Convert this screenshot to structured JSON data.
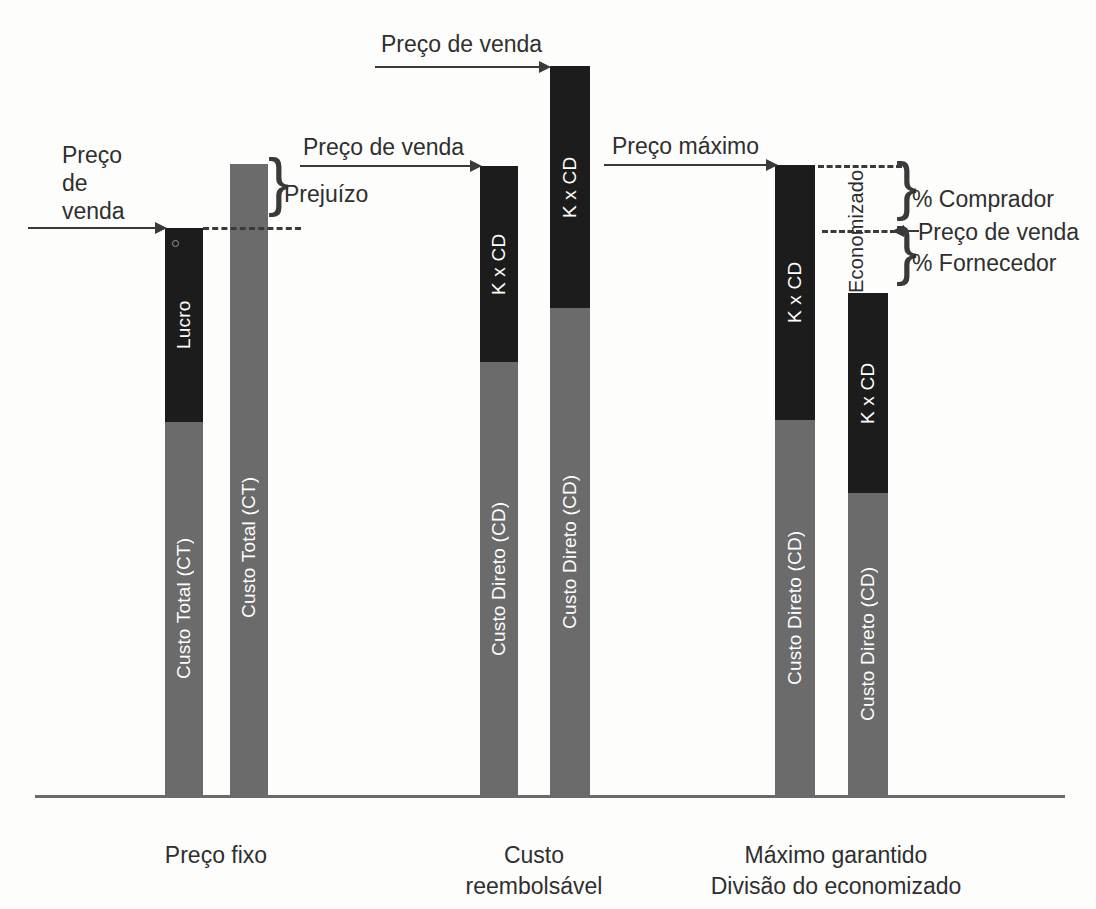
{
  "diagram": {
    "title_present": false,
    "axis_baseline_y": 795,
    "categories": [
      {
        "id": "preco-fixo",
        "lines": [
          "Preço fixo"
        ],
        "center_x": 216,
        "y": 840
      },
      {
        "id": "custo-reembolsavel",
        "lines": [
          "Custo",
          "reembolsável"
        ],
        "center_x": 534,
        "y": 840
      },
      {
        "id": "maximo-garantido",
        "lines": [
          "Máximo garantido",
          "Divisão do economizado"
        ],
        "center_x": 836,
        "y": 840
      }
    ],
    "bars": [
      {
        "id": "bar-1",
        "group": "preco-fixo",
        "x": 165,
        "width": 38,
        "top": 228,
        "split_y": 422,
        "top_label": "Lucro",
        "bottom_label": "Custo Total (CT)"
      },
      {
        "id": "bar-2",
        "group": "preco-fixo",
        "x": 230,
        "width": 38,
        "top": 164,
        "split_y": 164,
        "top_label": "",
        "bottom_label": "Custo Total (CT)"
      },
      {
        "id": "bar-3",
        "group": "custo-reembolsavel",
        "x": 480,
        "width": 38,
        "top": 166,
        "split_y": 362,
        "top_label": "K x CD",
        "bottom_label": "Custo Direto (CD)"
      },
      {
        "id": "bar-4",
        "group": "custo-reembolsavel",
        "x": 550,
        "width": 40,
        "top": 66,
        "split_y": 308,
        "top_label": "K x CD",
        "bottom_label": "Custo Direto (CD)"
      },
      {
        "id": "bar-5",
        "group": "maximo-garantido",
        "x": 775,
        "width": 40,
        "top": 165,
        "split_y": 420,
        "top_label": "K x CD",
        "bottom_label": "Custo Direto (CD)"
      },
      {
        "id": "bar-6",
        "group": "maximo-garantido",
        "x": 848,
        "width": 40,
        "top": 293,
        "split_y": 493,
        "top_label": "K x CD",
        "bottom_label": "Custo Direto (CD)"
      }
    ],
    "annotations": {
      "arrow_preco_venda_left": {
        "lines": [
          "Preço",
          "de",
          "venda"
        ],
        "text_x": 62,
        "text_y": 142,
        "line_x1": 28,
        "line_x2": 158,
        "line_y": 228
      },
      "brace_prejuizo": {
        "label": "Prejuízo",
        "text_x": 282,
        "text_y": 180,
        "brace_x": 268,
        "brace_top": 164,
        "brace_bottom": 228
      },
      "arrow_preco_venda_mid": {
        "label": "Preço de venda",
        "text_x": 303,
        "text_y": 134,
        "line_x1": 300,
        "line_x2": 474,
        "line_y": 166
      },
      "arrow_preco_venda_top": {
        "label": "Preço de venda",
        "text_x": 381,
        "text_y": 31,
        "line_x1": 375,
        "line_x2": 543,
        "line_y": 67
      },
      "arrow_preco_maximo": {
        "label": "Preço máximo",
        "text_x": 612,
        "text_y": 133,
        "line_x1": 604,
        "line_x2": 770,
        "line_y": 165
      },
      "dashed_top_left": {
        "x1": 203,
        "x2": 300,
        "y": 228
      },
      "dashed_top_right": {
        "x1": 818,
        "x2": 900,
        "y": 166
      },
      "dashed_mid_right": {
        "x1": 822,
        "x2": 895,
        "y": 231
      },
      "economizado": {
        "label": "Economizado",
        "center_x": 856,
        "top": 168,
        "bottom": 292
      },
      "brace_comprador": {
        "label": "% Comprador",
        "text_x": 912,
        "text_y": 186,
        "brace_x": 898,
        "brace_top": 168,
        "brace_bottom": 231
      },
      "label_preco_venda_right": {
        "label": "Preço de venda",
        "text_x": 920,
        "text_y": 219,
        "arrow_x1": 899,
        "arrow_x2": 916,
        "arrow_y": 231
      },
      "brace_fornecedor": {
        "label": "% Fornecedor",
        "text_x": 912,
        "text_y": 250,
        "brace_x": 898,
        "brace_top": 232,
        "brace_bottom": 294
      }
    },
    "colors": {
      "gray": "#6b6b6b",
      "black": "#1c1c1c",
      "text": "#2f2f2f",
      "line": "#3a3a3a"
    }
  }
}
